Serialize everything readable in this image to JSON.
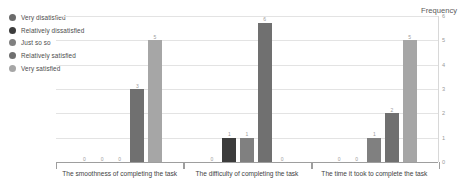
{
  "chart_data": {
    "type": "bar",
    "title": "",
    "xlabel": "",
    "ylabel": "Frequency",
    "ylim": [
      0,
      6
    ],
    "yticks": [
      "0",
      "1",
      "2",
      "3",
      "4",
      "5",
      "6"
    ],
    "grid": true,
    "legend_position": "top-left",
    "categories": [
      "The smoothness of completing the task",
      "The difficulty of completing the task",
      "The time it took to complete the task"
    ],
    "series": [
      {
        "name": "Very disatisfied",
        "color": "#6b6b6b",
        "values": [
          0,
          0,
          0
        ]
      },
      {
        "name": "Relatively dissatisfied",
        "color": "#3c3c3c",
        "values": [
          0,
          1,
          0
        ]
      },
      {
        "name": "Just so so",
        "color": "#808080",
        "values": [
          0,
          1,
          1
        ]
      },
      {
        "name": "Relatively satisfied",
        "color": "#707070",
        "values": [
          3,
          6,
          2
        ]
      },
      {
        "name": "Very satisfied",
        "color": "#a6a6a6",
        "values": [
          5,
          0,
          5
        ]
      }
    ]
  },
  "legend": {
    "items": [
      {
        "label": "Very disatisfied"
      },
      {
        "label": "Relatively dissatisfied"
      },
      {
        "label": "Just so so"
      },
      {
        "label": "Relatively satisfied"
      },
      {
        "label": "Very satisfied"
      }
    ]
  },
  "axis": {
    "y_title": "Frequency"
  }
}
